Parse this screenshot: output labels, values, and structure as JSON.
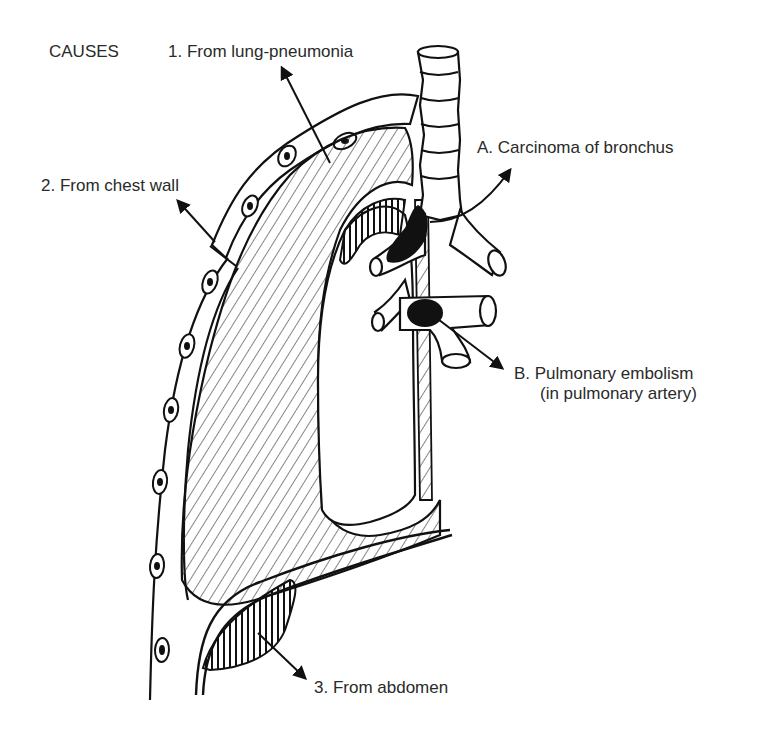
{
  "diagram": {
    "heading": "CAUSES",
    "labels": {
      "cause1": "1.  From lung-pneumonia",
      "cause2": "2.  From chest wall",
      "cause3": "3.  From abdomen",
      "causeA": "A.  Carcinoma of bronchus",
      "causeB_line1": "B.  Pulmonary embolism",
      "causeB_line2": "(in pulmonary artery)"
    },
    "colors": {
      "ink": "#111111",
      "text": "#2a2a2a",
      "background": "#ffffff"
    }
  }
}
